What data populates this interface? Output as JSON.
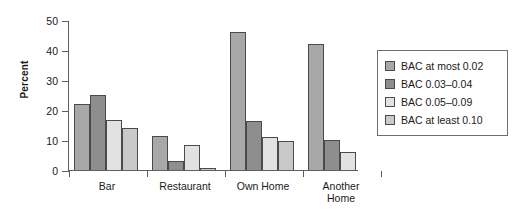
{
  "chart_data": {
    "type": "bar",
    "title": "",
    "xlabel": "",
    "ylabel": "Percent",
    "ylim": [
      0,
      50
    ],
    "yticks": [
      0,
      10,
      20,
      30,
      40,
      50
    ],
    "grid": false,
    "legend_position": "right",
    "categories": [
      "Bar",
      "Restaurant",
      "Own Home",
      "Another\nHome"
    ],
    "series": [
      {
        "name": "BAC at most 0.02",
        "color": "#a8a8a8",
        "values": [
          22.2,
          11.6,
          46.2,
          42.3
        ]
      },
      {
        "name": "BAC 0.03–0.04",
        "color": "#8e8e8e",
        "values": [
          25.5,
          3.5,
          16.7,
          10.2
        ]
      },
      {
        "name": "BAC 0.05–0.09",
        "color": "#e2e2e2",
        "values": [
          17.1,
          8.8,
          11.5,
          6.3
        ]
      },
      {
        "name": "BAC at least 0.10",
        "color": "#c9c9c9",
        "values": [
          14.2,
          1.1,
          9.9,
          0
        ]
      }
    ]
  },
  "axis": {
    "y_title": "Percent",
    "y_tick_labels": [
      "50",
      "40",
      "30",
      "20",
      "10",
      "0"
    ]
  },
  "legend": {
    "items": [
      {
        "label": "BAC at most 0.02",
        "color": "#a8a8a8"
      },
      {
        "label": "BAC 0.03–0.04",
        "color": "#8e8e8e"
      },
      {
        "label": "BAC 0.05–0.09",
        "color": "#e2e2e2"
      },
      {
        "label": "BAC at least 0.10",
        "color": "#c9c9c9"
      }
    ]
  },
  "colors": {
    "axis": "#5e5e5e",
    "bar_border": "#4a4a4a",
    "text": "#1a1a1a",
    "background": "#ffffff"
  }
}
